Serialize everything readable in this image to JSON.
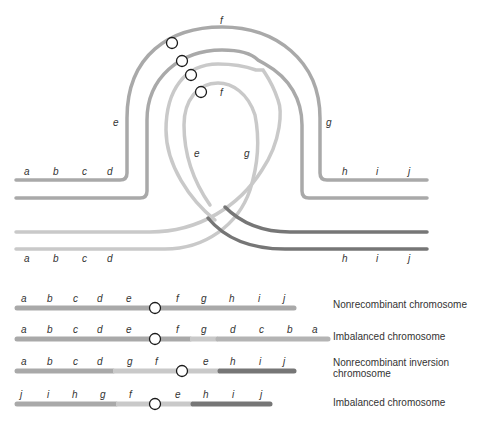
{
  "loop_diagram": {
    "outer_top_labels": {
      "f_top": "f",
      "e_left": "e",
      "g_right": "g"
    },
    "inner_labels": {
      "f_inner": "f",
      "e_inner": "e",
      "g_inner": "g"
    },
    "top_strand_left_labels": [
      "a",
      "b",
      "c",
      "d"
    ],
    "top_strand_right_labels": [
      "h",
      "i",
      "j"
    ],
    "bottom_strand_left_labels": [
      "a",
      "b",
      "c",
      "d"
    ],
    "bottom_strand_right_labels": [
      "h",
      "i",
      "j"
    ]
  },
  "products": [
    {
      "labels": [
        "a",
        "b",
        "c",
        "d",
        "e",
        "f",
        "g",
        "h",
        "i",
        "j"
      ],
      "description": "Nonrecombinant chromosome"
    },
    {
      "labels": [
        "a",
        "b",
        "c",
        "d",
        "e",
        "f",
        "g",
        "d",
        "c",
        "b",
        "a"
      ],
      "description": "Imbalanced chromosome"
    },
    {
      "labels": [
        "a",
        "b",
        "c",
        "d",
        "g",
        "f",
        "e",
        "h",
        "i",
        "j"
      ],
      "description_line1": "Nonrecombinant inversion",
      "description_line2": "chromosome"
    },
    {
      "labels": [
        "j",
        "i",
        "h",
        "g",
        "f",
        "e",
        "h",
        "i",
        "j"
      ],
      "description": "Imbalanced chromosome"
    }
  ],
  "colors": {
    "medium_gray": "#a9a9a9",
    "light_gray": "#c9c9c9",
    "dark_gray": "#767676",
    "centromere_stroke": "#1a1a1a"
  }
}
